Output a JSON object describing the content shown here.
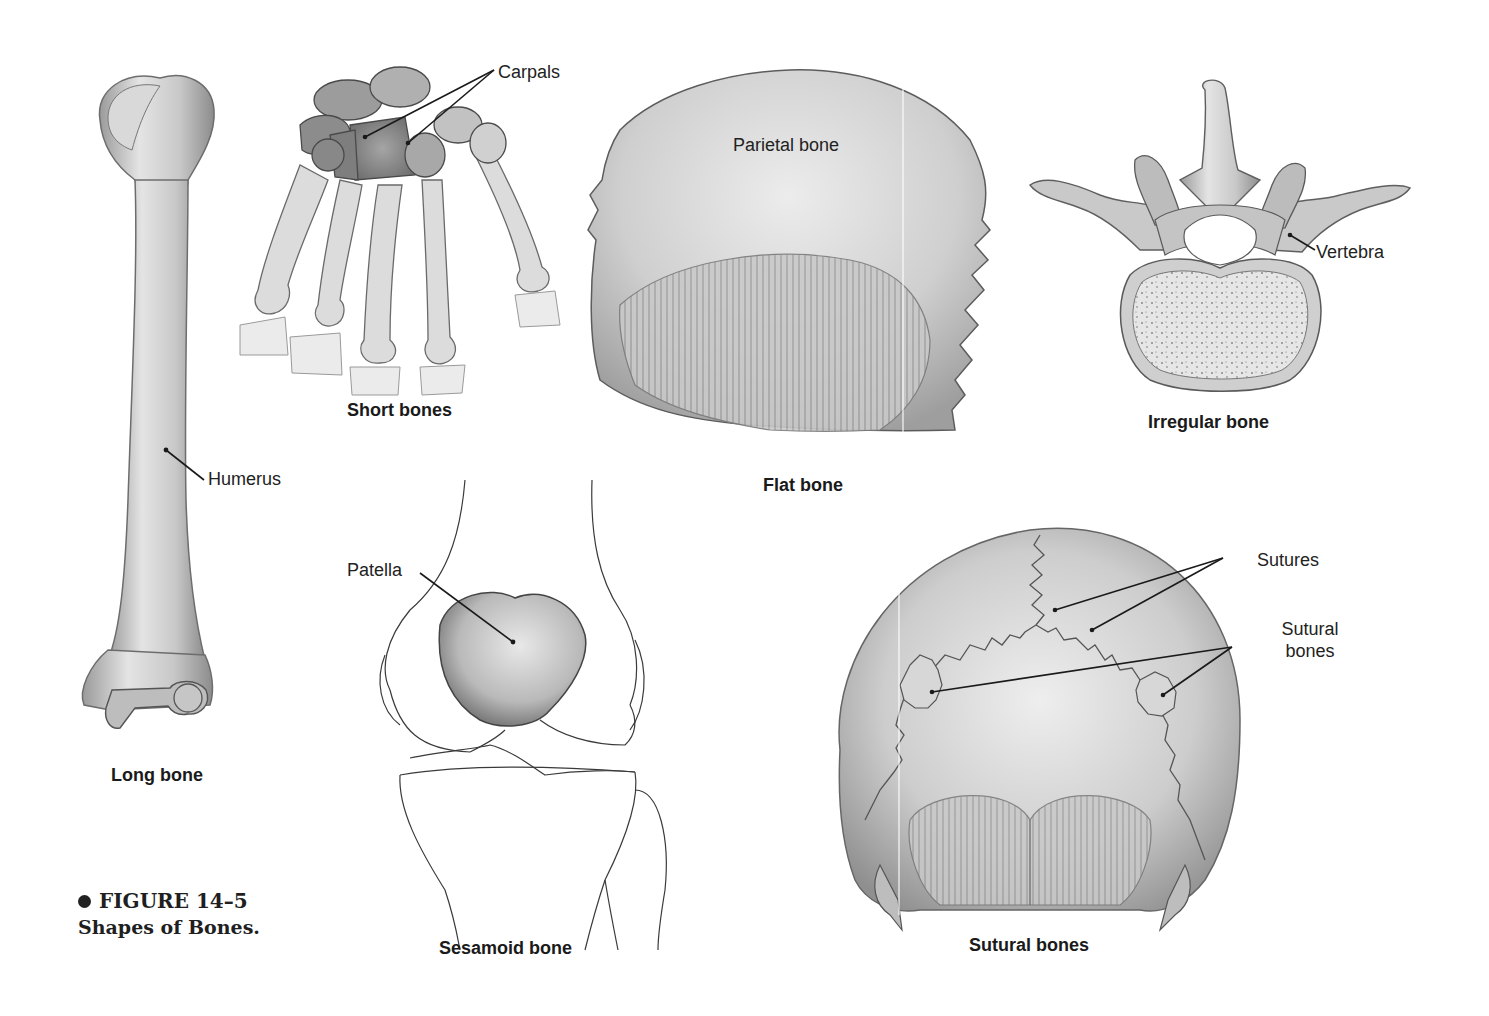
{
  "figure": {
    "number": "FIGURE 14–5",
    "title": "Shapes of Bones."
  },
  "panels": {
    "long_bone": {
      "caption": "Long bone",
      "labels": [
        "Humerus"
      ]
    },
    "short_bones": {
      "caption": "Short bones",
      "labels": [
        "Carpals"
      ]
    },
    "flat_bone": {
      "caption": "Flat bone",
      "labels": [
        "Parietal bone"
      ]
    },
    "irregular_bone": {
      "caption": "Irregular bone",
      "labels": [
        "Vertebra"
      ]
    },
    "sesamoid_bone": {
      "caption": "Sesamoid bone",
      "labels": [
        "Patella"
      ]
    },
    "sutural_bones": {
      "caption": "Sutural bones",
      "labels": [
        "Sutures",
        "Sutural bones"
      ]
    }
  },
  "colors": {
    "bone_light": "#e6e6e6",
    "bone_mid": "#bdbdbd",
    "bone_dark": "#8a8a8a",
    "outline": "#555555",
    "text": "#1a1a1a"
  }
}
